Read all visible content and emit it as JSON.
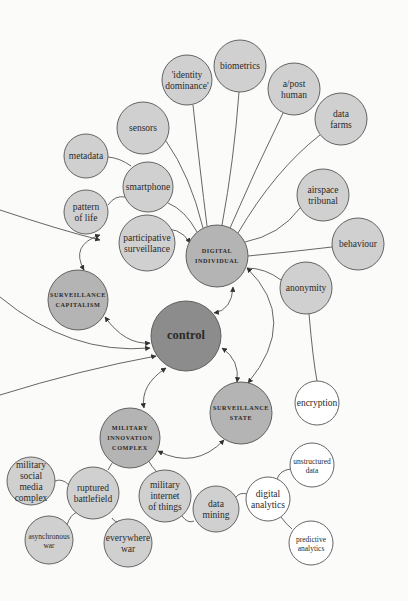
{
  "diagram": {
    "title": "",
    "colors": {
      "background": "#fbfbfa",
      "light": "#d0d0d0",
      "medium": "#b4b4b4",
      "dark": "#8c8c8c",
      "white": "#ffffff",
      "stroke": "#555555"
    },
    "nodes": [
      {
        "id": "identity-dominance",
        "lines": [
          "'identity",
          "dominance'"
        ],
        "x": 187,
        "y": 80,
        "r": 25,
        "fill": "light",
        "style": "regular"
      },
      {
        "id": "biometrics",
        "lines": [
          "biometrics"
        ],
        "x": 240,
        "y": 66,
        "r": 26,
        "fill": "light",
        "style": "regular"
      },
      {
        "id": "a-post-human",
        "lines": [
          "a/post",
          "human"
        ],
        "x": 294,
        "y": 89,
        "r": 26,
        "fill": "light",
        "style": "regular"
      },
      {
        "id": "data-farms",
        "lines": [
          "data",
          "farms"
        ],
        "x": 341,
        "y": 119,
        "r": 26,
        "fill": "light",
        "style": "regular"
      },
      {
        "id": "sensors",
        "lines": [
          "sensors"
        ],
        "x": 143,
        "y": 128,
        "r": 26,
        "fill": "light",
        "style": "regular"
      },
      {
        "id": "metadata",
        "lines": [
          "metadata"
        ],
        "x": 86,
        "y": 156,
        "r": 22,
        "fill": "light",
        "style": "regular"
      },
      {
        "id": "smartphone",
        "lines": [
          "smartphone"
        ],
        "x": 148,
        "y": 187,
        "r": 25,
        "fill": "light",
        "style": "regular"
      },
      {
        "id": "pattern-of-life",
        "lines": [
          "pattern",
          "of life"
        ],
        "x": 86,
        "y": 212,
        "r": 22,
        "fill": "light",
        "style": "regular"
      },
      {
        "id": "airspace-tribunal",
        "lines": [
          "airspace",
          "tribunal"
        ],
        "x": 323,
        "y": 195,
        "r": 26,
        "fill": "light",
        "style": "regular"
      },
      {
        "id": "participative-surveillance",
        "lines": [
          "participative",
          "surveillance"
        ],
        "x": 147,
        "y": 243,
        "r": 28,
        "fill": "light",
        "style": "regular"
      },
      {
        "id": "digital-individual",
        "lines": [
          "DIGITAL",
          "INDIVIDUAL"
        ],
        "x": 217,
        "y": 256,
        "r": 31,
        "fill": "medium",
        "style": "smallcaps"
      },
      {
        "id": "behaviour",
        "lines": [
          "behaviour"
        ],
        "x": 358,
        "y": 244,
        "r": 26,
        "fill": "light",
        "style": "regular"
      },
      {
        "id": "anonymity",
        "lines": [
          "anonymity"
        ],
        "x": 306,
        "y": 288,
        "r": 26,
        "fill": "light",
        "style": "regular"
      },
      {
        "id": "surveillance-capitalism",
        "lines": [
          "SURVEILLANCE",
          "CAPITALISM"
        ],
        "x": 78,
        "y": 300,
        "r": 30,
        "fill": "medium",
        "style": "smallcaps"
      },
      {
        "id": "control",
        "lines": [
          "control"
        ],
        "x": 186,
        "y": 336,
        "r": 35,
        "fill": "dark",
        "style": "big"
      },
      {
        "id": "encryption",
        "lines": [
          "encryption"
        ],
        "x": 317,
        "y": 403,
        "r": 22,
        "fill": "white",
        "style": "regular"
      },
      {
        "id": "surveillance-state",
        "lines": [
          "SURVEILLANCE",
          "STATE"
        ],
        "x": 241,
        "y": 413,
        "r": 31,
        "fill": "medium",
        "style": "smallcaps"
      },
      {
        "id": "military-innovation-complex",
        "lines": [
          "MILITARY",
          "INNOVATION",
          "COMPLEX"
        ],
        "x": 130,
        "y": 438,
        "r": 30,
        "fill": "medium",
        "style": "smallcaps"
      },
      {
        "id": "military-social-media-complex",
        "lines": [
          "military",
          "social",
          "media",
          "complex"
        ],
        "x": 31,
        "y": 481,
        "r": 24,
        "fill": "light",
        "style": "regular"
      },
      {
        "id": "ruptured-battlefield",
        "lines": [
          "ruptured",
          "battlefield"
        ],
        "x": 93,
        "y": 493,
        "r": 26,
        "fill": "light",
        "style": "regular"
      },
      {
        "id": "military-internet-of-things",
        "lines": [
          "military",
          "internet",
          "of things"
        ],
        "x": 165,
        "y": 496,
        "r": 26,
        "fill": "light",
        "style": "regular"
      },
      {
        "id": "data-mining",
        "lines": [
          "data",
          "mining"
        ],
        "x": 216,
        "y": 509,
        "r": 23,
        "fill": "light",
        "style": "regular"
      },
      {
        "id": "digital-analytics",
        "lines": [
          "digital",
          "analytics"
        ],
        "x": 268,
        "y": 499,
        "r": 22,
        "fill": "white",
        "style": "regular"
      },
      {
        "id": "unstructured-data",
        "lines": [
          "unstructured",
          "data"
        ],
        "x": 312,
        "y": 465,
        "r": 22,
        "fill": "white",
        "style": "small"
      },
      {
        "id": "predictive-analytics",
        "lines": [
          "predictive",
          "analytics"
        ],
        "x": 311,
        "y": 543,
        "r": 22,
        "fill": "white",
        "style": "small"
      },
      {
        "id": "asynchronous-war",
        "lines": [
          "asynchronous",
          "war"
        ],
        "x": 49,
        "y": 540,
        "r": 24,
        "fill": "light",
        "style": "small"
      },
      {
        "id": "everywhere-war",
        "lines": [
          "everywhere",
          "war"
        ],
        "x": 128,
        "y": 543,
        "r": 24,
        "fill": "light",
        "style": "regular"
      }
    ],
    "edges": [
      {
        "d": "M193,105 Q200,170 207,226",
        "arrows": ""
      },
      {
        "d": "M239,92 Q234,160 222,225",
        "arrows": ""
      },
      {
        "d": "M283,113 Q255,170 230,228",
        "arrows": ""
      },
      {
        "d": "M320,135 Q275,170 238,233",
        "arrows": ""
      },
      {
        "d": "M166,141 Q190,175 203,228",
        "arrows": ""
      },
      {
        "d": "M108,157 Q120,158 131,166",
        "arrows": ""
      },
      {
        "d": "M108,205 Q115,195 125,197",
        "arrows": ""
      },
      {
        "d": "M168,203 Q185,210 197,232",
        "arrows": ""
      },
      {
        "d": "M300,208 Q280,235 245,242",
        "arrows": ""
      },
      {
        "d": "M332,247 Q290,252 248,256",
        "arrows": ""
      },
      {
        "d": "M281,280 Q265,268 247,268",
        "arrows": ""
      },
      {
        "d": "M309,314 Q313,360 317,381",
        "arrows": ""
      },
      {
        "d": "M0,210 Q60,230 100,240",
        "arrows": "end"
      },
      {
        "d": "M156,230 Q180,225 190,243",
        "arrows": "both"
      },
      {
        "d": "M100,235 Q70,245 84,270",
        "arrows": "both"
      },
      {
        "d": "M105,317 Q125,345 150,343",
        "arrows": "both"
      },
      {
        "d": "M0,297 Q70,355 150,348",
        "arrows": "end"
      },
      {
        "d": "M0,395 Q80,370 156,356",
        "arrows": "end"
      },
      {
        "d": "M233,287 Q232,310 214,313",
        "arrows": "both"
      },
      {
        "d": "M247,268 Q300,320 248,383",
        "arrows": "both"
      },
      {
        "d": "M222,348 Q240,360 237,382",
        "arrows": "both"
      },
      {
        "d": "M166,368 Q140,385 144,408",
        "arrows": "both"
      },
      {
        "d": "M158,451 Q195,470 224,440",
        "arrows": "both"
      },
      {
        "d": "M108,470 Q112,462 115,460",
        "arrows": ""
      },
      {
        "d": "M148,460 Q152,467 156,471",
        "arrows": ""
      },
      {
        "d": "M55,481 Q62,478 69,485",
        "arrows": ""
      },
      {
        "d": "M67,525 Q70,515 77,512",
        "arrows": ""
      },
      {
        "d": "M112,518 Q115,523 119,521",
        "arrows": ""
      },
      {
        "d": "M182,516 Q188,524 194,521",
        "arrows": ""
      },
      {
        "d": "M236,497 Q240,492 247,494",
        "arrows": ""
      },
      {
        "d": "M277,479 Q280,470 291,469",
        "arrows": ""
      },
      {
        "d": "M281,517 Q286,524 292,529",
        "arrows": ""
      }
    ]
  }
}
